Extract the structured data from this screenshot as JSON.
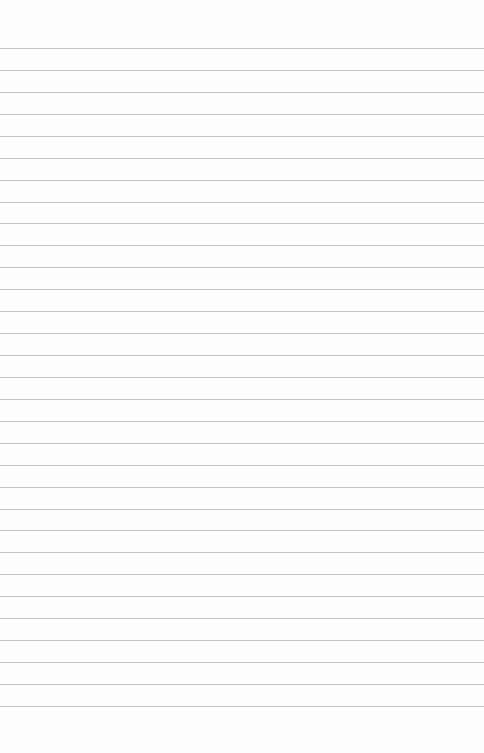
{
  "paper": {
    "background": "#fdfdfd",
    "line_color": "#b9b9b9",
    "line_count": 31,
    "first_line_y": 48,
    "line_spacing": 21.93
  }
}
